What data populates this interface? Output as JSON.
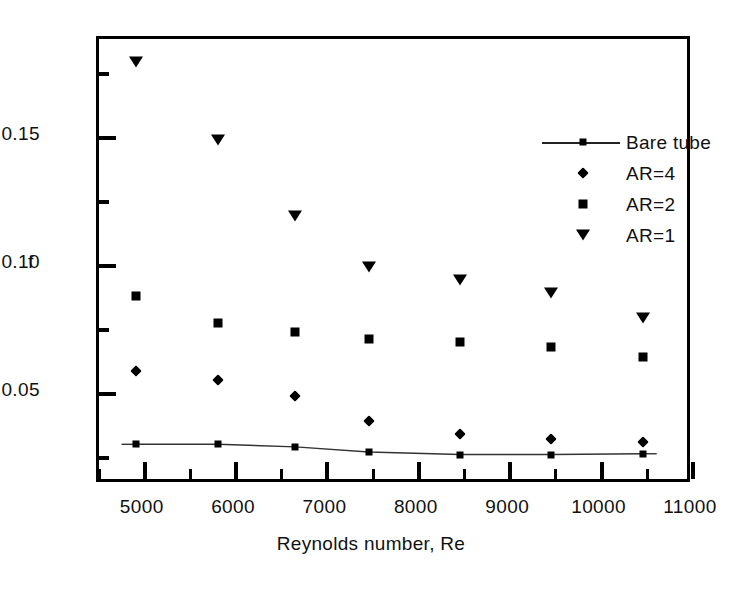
{
  "chart_data": {
    "type": "scatter",
    "title": "",
    "xlabel": "Reynolds number, Re",
    "ylabel": "f",
    "xlim": [
      4500,
      11000
    ],
    "ylim": [
      0.0146,
      0.1888
    ],
    "grid": false,
    "legend_position": "top-right",
    "x_ticks": [
      5000,
      6000,
      7000,
      8000,
      9000,
      10000,
      11000
    ],
    "x_tick_labels": [
      "5000",
      "6000",
      "7000",
      "8000",
      "9000",
      "10000",
      "11000"
    ],
    "x_minor_ticks": [
      4500,
      5500,
      6500,
      7500,
      8500,
      9500,
      10500
    ],
    "y_ticks": [
      0.05,
      0.1,
      0.15
    ],
    "y_tick_labels": [
      "0.05",
      "0.10",
      "0.15"
    ],
    "y_minor_ticks": [
      0.025,
      0.075,
      0.125,
      0.175
    ],
    "x": [
      4900,
      5800,
      6650,
      7450,
      8450,
      9450,
      10450
    ],
    "series": [
      {
        "name": "Bare tube",
        "marker": "square-line",
        "values": [
          0.0305,
          0.0305,
          0.0295,
          0.0275,
          0.0265,
          0.0265,
          0.0268
        ]
      },
      {
        "name": "AR=4",
        "marker": "diamond",
        "values": [
          0.059,
          0.0555,
          0.0495,
          0.0395,
          0.0345,
          0.0325,
          0.0315
        ]
      },
      {
        "name": "AR=2",
        "marker": "square",
        "values": [
          0.0885,
          0.078,
          0.0745,
          0.0715,
          0.0705,
          0.0685,
          0.0645
        ]
      },
      {
        "name": "AR=1",
        "marker": "triangle-down",
        "values": [
          0.18,
          0.1495,
          0.1195,
          0.0998,
          0.0945,
          0.0895,
          0.08
        ]
      }
    ]
  },
  "legend": {
    "items": [
      {
        "label": "Bare tube",
        "marker": "square-line"
      },
      {
        "label": "AR=4",
        "marker": "diamond"
      },
      {
        "label": "AR=2",
        "marker": "square"
      },
      {
        "label": "AR=1",
        "marker": "triangle-down"
      }
    ]
  },
  "axes": {
    "x_title": "Reynolds number, Re",
    "y_title": "f"
  },
  "colors": {
    "foreground": "#000000",
    "background": "#ffffff",
    "line": "#333333"
  }
}
